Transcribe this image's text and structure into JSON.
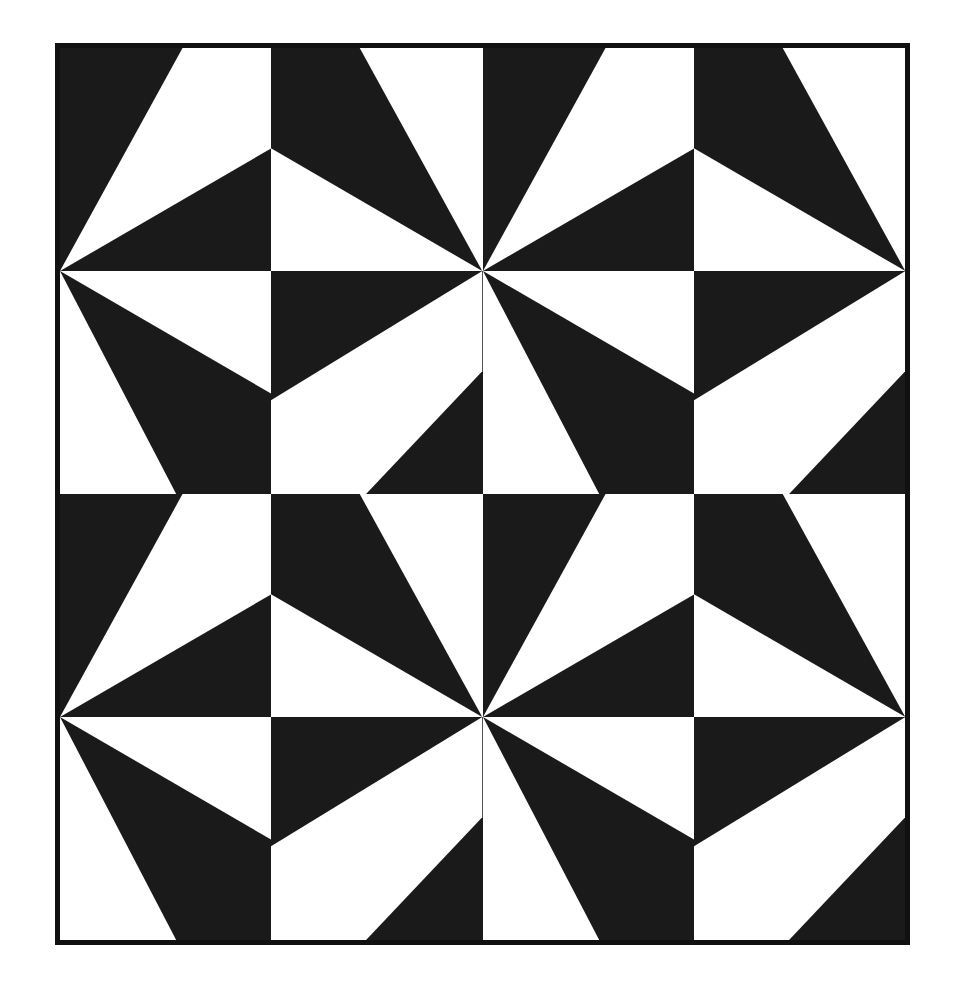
{
  "artwork": {
    "title": "Pinwheel Triangle Tiling",
    "canvas": {
      "width": 957,
      "height": 1002,
      "background": "#ffffff"
    },
    "frame": {
      "x": 55,
      "y": 43,
      "width": 855,
      "height": 902,
      "border_width": 5,
      "border_color": "#111111",
      "fill_color": "#ffffff"
    },
    "colors": {
      "ink": "#1a1a1a",
      "paper": "#ffffff",
      "border": "#111111"
    },
    "grid": {
      "columns": 4,
      "rows": 4,
      "tile_width": 213.75,
      "tile_height": 225.5,
      "x": 60,
      "y": 48,
      "width": 845,
      "height": 892
    },
    "motif": {
      "name": "pinwheel",
      "description": "Four-tile repeating unit; each tile is a quadrilateral wedge. Adjacent tiles meet at shared corners forming twelve-ray radial bursts.",
      "unit_cell_columns": 2,
      "unit_cell_rows": 2,
      "ray_count_per_burst": 12,
      "burst_centers": [
        {
          "cx": 55,
          "cy": 272
        },
        {
          "cx": 483,
          "cy": 272
        },
        {
          "cx": 910,
          "cy": 272
        },
        {
          "cx": 55,
          "cy": 717
        },
        {
          "cx": 483,
          "cy": 717
        },
        {
          "cx": 910,
          "cy": 717
        }
      ]
    },
    "tiles": [
      {
        "id": "tile-r1c1",
        "row": 1,
        "col": 1,
        "variant": "A",
        "background": "ink",
        "shape_fill": "paper",
        "points": "0,100 58,0 100,0 100,45"
      },
      {
        "id": "tile-r1c2",
        "row": 1,
        "col": 2,
        "variant": "B",
        "background": "paper",
        "shape_fill": "ink",
        "points": "0,0 42,0 100,100 0,45"
      },
      {
        "id": "tile-r1c3",
        "row": 1,
        "col": 3,
        "variant": "A",
        "background": "ink",
        "shape_fill": "paper",
        "points": "0,100 58,0 100,0 100,45"
      },
      {
        "id": "tile-r1c4",
        "row": 1,
        "col": 4,
        "variant": "B",
        "background": "paper",
        "shape_fill": "ink",
        "points": "0,0 42,0 100,100 0,45"
      },
      {
        "id": "tile-r2c1",
        "row": 2,
        "col": 1,
        "variant": "C",
        "background": "paper",
        "shape_fill": "ink",
        "points": "0,0 100,55 100,100 55,100"
      },
      {
        "id": "tile-r2c2",
        "row": 2,
        "col": 2,
        "variant": "D",
        "background": "ink",
        "shape_fill": "paper",
        "points": "100,0 100,45 45,100 0,100 0,58"
      },
      {
        "id": "tile-r2c3",
        "row": 2,
        "col": 3,
        "variant": "C",
        "background": "paper",
        "shape_fill": "ink",
        "points": "0,0 100,55 100,100 55,100"
      },
      {
        "id": "tile-r2c4",
        "row": 2,
        "col": 4,
        "variant": "D",
        "background": "ink",
        "shape_fill": "paper",
        "points": "100,0 100,45 45,100 0,100 0,58"
      },
      {
        "id": "tile-r3c1",
        "row": 3,
        "col": 1,
        "variant": "A",
        "background": "ink",
        "shape_fill": "paper",
        "points": "0,100 58,0 100,0 100,45"
      },
      {
        "id": "tile-r3c2",
        "row": 3,
        "col": 2,
        "variant": "B",
        "background": "paper",
        "shape_fill": "ink",
        "points": "0,0 42,0 100,100 0,45"
      },
      {
        "id": "tile-r3c3",
        "row": 3,
        "col": 3,
        "variant": "A",
        "background": "ink",
        "shape_fill": "paper",
        "points": "0,100 58,0 100,0 100,45"
      },
      {
        "id": "tile-r3c4",
        "row": 3,
        "col": 4,
        "variant": "B",
        "background": "paper",
        "shape_fill": "ink",
        "points": "0,0 42,0 100,100 0,45"
      },
      {
        "id": "tile-r4c1",
        "row": 4,
        "col": 1,
        "variant": "C",
        "background": "paper",
        "shape_fill": "ink",
        "points": "0,0 100,55 100,100 55,100"
      },
      {
        "id": "tile-r4c2",
        "row": 4,
        "col": 2,
        "variant": "D",
        "background": "ink",
        "shape_fill": "paper",
        "points": "100,0 100,45 45,100 0,100 0,58"
      },
      {
        "id": "tile-r4c3",
        "row": 4,
        "col": 3,
        "variant": "C",
        "background": "paper",
        "shape_fill": "ink",
        "points": "0,0 100,55 100,100 55,100"
      },
      {
        "id": "tile-r4c4",
        "row": 4,
        "col": 4,
        "variant": "D",
        "background": "ink",
        "shape_fill": "paper",
        "points": "100,0 100,45 45,100 0,100 0,58"
      }
    ]
  }
}
